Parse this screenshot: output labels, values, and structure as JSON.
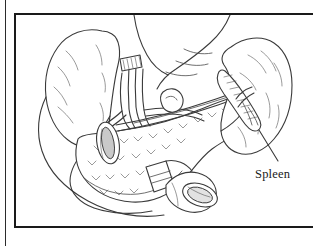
{
  "page": {
    "background_color": "#ffffff",
    "width": 313,
    "height": 246
  },
  "margin_rule": {
    "color": "#2b2b2b"
  },
  "figure": {
    "frame_color": "#1a1a1a",
    "background_color": "#ffffff",
    "line_color": "#3a3a3a",
    "illustration_type": "line-drawing",
    "annotations": [
      {
        "name": "spleen",
        "label": "Spleen",
        "leader_line": true
      }
    ]
  },
  "callout": {
    "spleen_label": "Spleen"
  }
}
